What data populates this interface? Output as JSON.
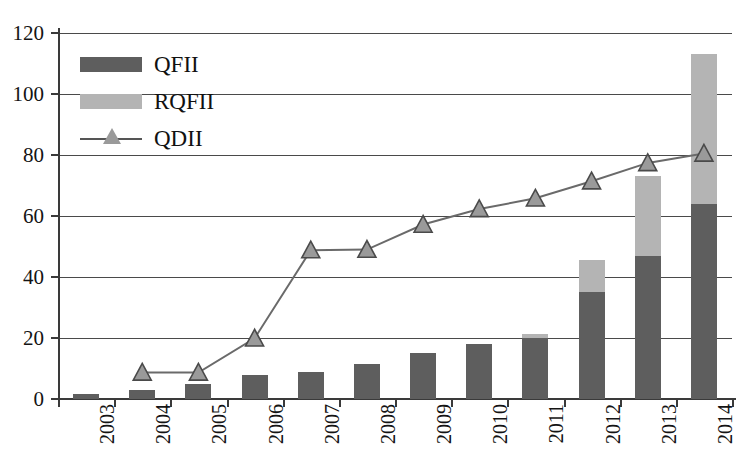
{
  "chart_data": {
    "type": "bar",
    "title": "",
    "subtitle": "",
    "xlabel": "",
    "ylabel": "",
    "categories": [
      "2003",
      "2004",
      "2005",
      "2006",
      "2007",
      "2008",
      "2009",
      "2010",
      "2011",
      "2012",
      "2013",
      "2014"
    ],
    "ylim": [
      0,
      120
    ],
    "yticks": [
      0,
      20,
      40,
      60,
      80,
      100,
      120
    ],
    "ytick_labels": [
      "0",
      "20",
      "40",
      "60",
      "80",
      "100",
      "120"
    ],
    "grid": "horizontal",
    "legend_position": "top-left",
    "stacked": true,
    "series": [
      {
        "name": "QFII",
        "type": "bar",
        "color": "#5e5e5e",
        "values": [
          1.5,
          3.0,
          5.0,
          8.0,
          8.8,
          11.6,
          15.0,
          18.0,
          20.0,
          35.0,
          47.0,
          64.0
        ]
      },
      {
        "name": "RQFII",
        "type": "bar",
        "color": "#b4b4b4",
        "values": [
          0,
          0,
          0,
          0,
          0,
          0,
          0,
          0,
          1.3,
          10.6,
          26.0,
          49.0
        ]
      },
      {
        "name": "QDII",
        "type": "line",
        "color": "#6a6a6a",
        "marker": "triangle",
        "values": [
          null,
          8.7,
          8.7,
          19.9,
          48.8,
          49.0,
          57.2,
          62.3,
          65.8,
          71.4,
          77.4,
          80.5
        ]
      }
    ]
  },
  "legend": {
    "items": [
      {
        "label": "QFII",
        "swatch": "bar-dark-gray"
      },
      {
        "label": "RQFII",
        "swatch": "bar-light-gray"
      },
      {
        "label": "QDII",
        "swatch": "line-triangle-marker"
      }
    ]
  },
  "colors": {
    "qfii": "#5e5e5e",
    "rqfii": "#b4b4b4",
    "qdii_line": "#6a6a6a",
    "qdii_marker_fill": "#9a9a9a",
    "axis": "#3a3a3a",
    "grid": "#4a4a4a",
    "background": "#ffffff"
  }
}
